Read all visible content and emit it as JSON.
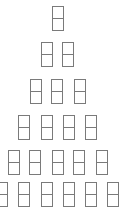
{
  "diagram": {
    "type": "pyramid",
    "stroke_color": "#7a7a7a",
    "background": "#ffffff",
    "cell": {
      "width": 12,
      "height": 25,
      "split": "horizontal-middle"
    },
    "rows": [
      {
        "y": 6,
        "xs": [
          52
        ]
      },
      {
        "y": 42,
        "xs": [
          41,
          62
        ]
      },
      {
        "y": 79,
        "xs": [
          30,
          51,
          74
        ]
      },
      {
        "y": 115,
        "xs": [
          18,
          41,
          63,
          85
        ]
      },
      {
        "y": 150,
        "xs": [
          8,
          29,
          52,
          73,
          96
        ]
      },
      {
        "y": 182,
        "xs": [
          -4,
          18,
          41,
          63,
          85,
          107
        ]
      }
    ]
  }
}
